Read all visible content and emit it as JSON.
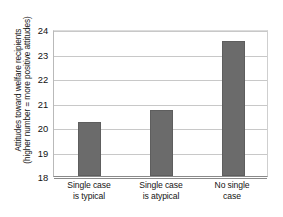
{
  "chart_data": {
    "type": "bar",
    "title": "",
    "xlabel": "",
    "ylabel": "Attitudes toward welfare recipients (higher number = more positive attitudes)",
    "ylabel_line1": "Attitudes toward welfare recipients",
    "ylabel_line2": "(higher number = more positive attitudes)",
    "categories": [
      "Single case is typical",
      "Single case is atypical",
      "No single case"
    ],
    "category_lines": [
      [
        "Single case",
        "is typical"
      ],
      [
        "Single case",
        "is atypical"
      ],
      [
        "No single",
        "case"
      ]
    ],
    "values": [
      20.2,
      20.7,
      23.5
    ],
    "ylim": [
      18,
      24
    ],
    "yticks": [
      18,
      19,
      20,
      21,
      22,
      23,
      24
    ],
    "ytick_labels": [
      "18",
      "19",
      "20",
      "21",
      "22",
      "23",
      "24"
    ],
    "grid": true,
    "legend": false,
    "bar_color": "#6b6b6b",
    "gridline_color": "#c8c8c8",
    "axis_color": "#8a8a8a",
    "background_color": "#ffffff"
  }
}
